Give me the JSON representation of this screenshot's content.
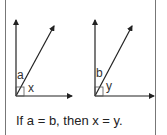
{
  "diagram": {
    "left_figure": {
      "angle_label_top": "a",
      "angle_label_right": "x"
    },
    "right_figure": {
      "angle_label_top": "b",
      "angle_label_right": "y"
    },
    "caption": "If a = b, then x = y.",
    "colors": {
      "line": "#222222",
      "border": "#777777",
      "background": "#ffffff"
    }
  }
}
